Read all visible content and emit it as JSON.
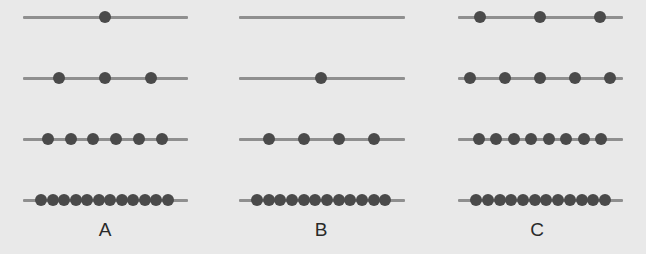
{
  "diagram": {
    "row_y": [
      17,
      78,
      139,
      200
    ],
    "colors": {
      "background": "#e9e9e9",
      "line": "#8f8f8f",
      "dot": "#4a4a4a",
      "label": "#2a2a2a"
    },
    "groups": [
      {
        "label": "A",
        "line_x": [
          23,
          188
        ],
        "label_x": 105,
        "rows": [
          {
            "count": 1,
            "dots": [
              105
            ]
          },
          {
            "count": 3,
            "dots": [
              59,
              105,
              151
            ]
          },
          {
            "count": 6,
            "dots": [
              48,
              71,
              93,
              116,
              139,
              162
            ]
          },
          {
            "count": 12,
            "dots": [
              41,
              52.5,
              64,
              75.5,
              87,
              98.5,
              110,
              121.5,
              133,
              144.5,
              156,
              168
            ]
          }
        ]
      },
      {
        "label": "B",
        "line_x": [
          239,
          405
        ],
        "label_x": 321,
        "rows": [
          {
            "count": 0,
            "dots": []
          },
          {
            "count": 1,
            "dots": [
              321
            ]
          },
          {
            "count": 4,
            "dots": [
              269,
              304,
              339,
              374
            ]
          },
          {
            "count": 12,
            "dots": [
              257,
              268.6,
              280.3,
              292,
              303.6,
              315.3,
              327,
              338.6,
              350.3,
              362,
              373.6,
              385
            ]
          }
        ]
      },
      {
        "label": "C",
        "line_x": [
          458,
          623
        ],
        "label_x": 537,
        "rows": [
          {
            "count": 3,
            "dots": [
              480,
              540,
              600
            ]
          },
          {
            "count": 5,
            "dots": [
              470,
              505,
              540,
              575,
              610
            ]
          },
          {
            "count": 8,
            "dots": [
              479,
              496.4,
              513.9,
              531.3,
              548.7,
              566.1,
              583.6,
              601
            ]
          },
          {
            "count": 12,
            "dots": [
              476,
              487.7,
              499.5,
              511.2,
              522.9,
              534.6,
              546.4,
              558.1,
              569.8,
              581.5,
              593.3,
              605
            ]
          }
        ]
      }
    ]
  }
}
